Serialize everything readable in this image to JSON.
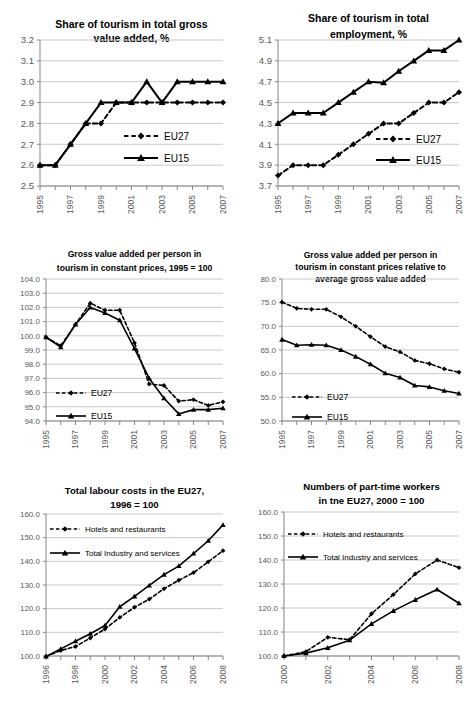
{
  "figure": {
    "panels": [
      {
        "id": "share-gva",
        "chart_data": {
          "type": "line",
          "title": "Share of tourism in total gross value added, %",
          "title_lines": [
            "Share of tourism in total gross",
            "value added, %"
          ],
          "title_bold": true,
          "xlabel": "",
          "ylabel": "",
          "x": [
            1995,
            1996,
            1997,
            1998,
            1999,
            2000,
            2001,
            2002,
            2003,
            2004,
            2005,
            2006,
            2007
          ],
          "xtick_labels": [
            "1995",
            "1997",
            "1999",
            "2001",
            "2003",
            "2005",
            "2007"
          ],
          "xtick_values": [
            1995,
            1997,
            1999,
            2001,
            2003,
            2005,
            2007
          ],
          "ylim": [
            2.5,
            3.2
          ],
          "yticks": [
            2.5,
            2.6,
            2.7,
            2.8,
            2.9,
            3.0,
            3.1,
            3.2
          ],
          "ytick_labels": [
            "2.5",
            "2.6",
            "2.7",
            "2.8",
            "2.9",
            "3.0",
            "3.1",
            "3.2"
          ],
          "grid": true,
          "legend_position": "inside-center-right",
          "series": [
            {
              "name": "EU27",
              "style": "dashed",
              "marker": "diamond",
              "values": [
                2.6,
                2.6,
                2.7,
                2.8,
                2.8,
                2.9,
                2.9,
                2.9,
                2.9,
                2.9,
                2.9,
                2.9,
                2.9
              ]
            },
            {
              "name": "EU15",
              "style": "solid",
              "marker": "triangle",
              "values": [
                2.6,
                2.6,
                2.7,
                2.8,
                2.9,
                2.9,
                2.9,
                3.0,
                2.9,
                3.0,
                3.0,
                3.0,
                3.0
              ]
            }
          ]
        }
      },
      {
        "id": "share-employment",
        "chart_data": {
          "type": "line",
          "title": "Share of tourism in total employment, %",
          "title_lines": [
            "Share of tourism in total",
            "employment, %"
          ],
          "title_bold": true,
          "xlabel": "",
          "ylabel": "",
          "x": [
            1995,
            1996,
            1997,
            1998,
            1999,
            2000,
            2001,
            2002,
            2003,
            2004,
            2005,
            2006,
            2007
          ],
          "xtick_labels": [
            "1995",
            "1997",
            "1999",
            "2001",
            "2003",
            "2005",
            "2007"
          ],
          "xtick_values": [
            1995,
            1997,
            1999,
            2001,
            2003,
            2005,
            2007
          ],
          "ylim": [
            3.7,
            5.1
          ],
          "yticks": [
            3.7,
            3.9,
            4.1,
            4.3,
            4.5,
            4.7,
            4.9,
            5.1
          ],
          "ytick_labels": [
            "3.7",
            "3.9",
            "4.1",
            "4.3",
            "4.5",
            "4.7",
            "4.9",
            "5.1"
          ],
          "grid": true,
          "legend_position": "inside-center-right",
          "series": [
            {
              "name": "EU27",
              "style": "dashed",
              "marker": "diamond",
              "values": [
                3.8,
                3.9,
                3.9,
                3.9,
                4.0,
                4.1,
                4.2,
                4.3,
                4.3,
                4.4,
                4.5,
                4.5,
                4.6
              ]
            },
            {
              "name": "EU15",
              "style": "solid",
              "marker": "triangle",
              "values": [
                4.3,
                4.4,
                4.4,
                4.4,
                4.5,
                4.6,
                4.7,
                4.69,
                4.8,
                4.9,
                5.0,
                5.0,
                5.1
              ]
            }
          ]
        }
      },
      {
        "id": "gva-per-person",
        "chart_data": {
          "type": "line",
          "title": "Gross value added per person in tourism in constant prices, 1995 = 100",
          "title_lines": [
            "Gross value added per person in",
            "tourism in constant prices, 1995 = 100"
          ],
          "title_bold": true,
          "xlabel": "",
          "ylabel": "",
          "x": [
            1995,
            1996,
            1997,
            1998,
            1999,
            2000,
            2001,
            2002,
            2003,
            2004,
            2005,
            2006,
            2007
          ],
          "xtick_labels": [
            "1995",
            "1997",
            "1999",
            "2001",
            "2003",
            "2005",
            "2007"
          ],
          "xtick_values": [
            1995,
            1997,
            1999,
            2001,
            2003,
            2005,
            2007
          ],
          "ylim": [
            94.0,
            104.0
          ],
          "yticks": [
            94.0,
            95.0,
            96.0,
            97.0,
            98.0,
            99.0,
            100.0,
            101.0,
            102.0,
            103.0,
            104.0
          ],
          "ytick_labels": [
            "94.0",
            "95.0",
            "96.0",
            "97.0",
            "98.0",
            "99.0",
            "100.0",
            "101.0",
            "102.0",
            "103.0",
            "104.0"
          ],
          "grid": true,
          "legend_position": "inside-left",
          "series": [
            {
              "name": "EU27",
              "style": "dashed",
              "marker": "diamond",
              "values": [
                99.9,
                99.3,
                100.8,
                102.3,
                101.8,
                101.8,
                99.5,
                96.6,
                96.5,
                95.4,
                95.5,
                95.1,
                95.35
              ]
            },
            {
              "name": "EU15",
              "style": "solid",
              "marker": "triangle",
              "values": [
                99.9,
                99.2,
                100.8,
                102.0,
                101.6,
                101.1,
                99.1,
                97.0,
                95.6,
                94.5,
                94.8,
                94.8,
                94.9
              ]
            }
          ]
        }
      },
      {
        "id": "gva-relative",
        "chart_data": {
          "type": "line",
          "title": "Gross value added per person in tourism in constant prices relative to average gross value added",
          "title_lines": [
            "Gross value added per person in",
            "tourism in constant prices relative to",
            "average gross value added"
          ],
          "title_bold": false,
          "xlabel": "",
          "ylabel": "",
          "x": [
            1995,
            1996,
            1997,
            1998,
            1999,
            2000,
            2001,
            2002,
            2003,
            2004,
            2005,
            2006,
            2007
          ],
          "xtick_labels": [
            "1995",
            "1997",
            "1999",
            "2001",
            "2003",
            "2005",
            "2007"
          ],
          "xtick_values": [
            1995,
            1997,
            1999,
            2001,
            2003,
            2005,
            2007
          ],
          "ylim": [
            50.0,
            80.0
          ],
          "yticks": [
            50.0,
            55.0,
            60.0,
            65.0,
            70.0,
            75.0,
            80.0
          ],
          "ytick_labels": [
            "50.0",
            "55.0",
            "60.0",
            "65.0",
            "70.0",
            "75.0",
            "80.0"
          ],
          "grid": true,
          "legend_position": "inside-left-lower",
          "series": [
            {
              "name": "EU27",
              "style": "dashed",
              "marker": "diamond",
              "values": [
                75.1,
                73.8,
                73.6,
                73.6,
                72.0,
                70.0,
                67.8,
                65.7,
                64.6,
                62.8,
                62.1,
                61.0,
                60.3
              ]
            },
            {
              "name": "EU15",
              "style": "solid",
              "marker": "triangle",
              "values": [
                67.2,
                66.0,
                66.1,
                66.0,
                65.0,
                63.6,
                62.0,
                60.1,
                59.2,
                57.5,
                57.2,
                56.4,
                55.8
              ]
            }
          ]
        }
      },
      {
        "id": "labour-costs",
        "chart_data": {
          "type": "line",
          "title": "Total labour costs in the EU27, 1996 = 100",
          "title_lines": [
            "Total labour costs in the EU27,",
            "1996 = 100"
          ],
          "title_bold": true,
          "xlabel": "",
          "ylabel": "",
          "x": [
            1996,
            1997,
            1998,
            1999,
            2000,
            2001,
            2002,
            2003,
            2004,
            2005,
            2006,
            2007,
            2008
          ],
          "xtick_labels": [
            "1996",
            "1998",
            "2000",
            "2002",
            "2004",
            "2006",
            "2008"
          ],
          "xtick_values": [
            1996,
            1998,
            2000,
            2002,
            2004,
            2006,
            2008
          ],
          "ylim": [
            100.0,
            160.0
          ],
          "yticks": [
            100.0,
            110.0,
            120.0,
            130.0,
            140.0,
            150.0,
            160.0
          ],
          "ytick_labels": [
            "100.0",
            "110.0",
            "120.0",
            "130.0",
            "140.0",
            "150.0",
            "160.0"
          ],
          "grid": true,
          "legend_position": "inside-top-left",
          "series": [
            {
              "name": "Hotels and restaurants",
              "style": "dashed",
              "marker": "diamond",
              "values": [
                99.8,
                102.3,
                104.0,
                107.6,
                111.4,
                116.3,
                120.6,
                124.0,
                128.4,
                132.0,
                135.2,
                139.8,
                144.5
              ]
            },
            {
              "name": "Total Industry and services",
              "style": "solid",
              "marker": "triangle",
              "values": [
                99.8,
                103.0,
                106.2,
                109.4,
                112.9,
                120.8,
                125.2,
                129.8,
                134.4,
                138.0,
                143.3,
                148.7,
                155.4
              ]
            }
          ]
        }
      },
      {
        "id": "part-time-workers",
        "chart_data": {
          "type": "line",
          "title": "Numbers of part-time workers in tne EU27, 2000 = 100",
          "title_lines": [
            "Numbers of part-time workers",
            "in tne EU27, 2000 = 100"
          ],
          "title_bold": true,
          "xlabel": "",
          "ylabel": "",
          "x": [
            2000,
            2001,
            2002,
            2003,
            2004,
            2005,
            2006,
            2007,
            2008
          ],
          "xtick_labels": [
            "2000",
            "2002",
            "2004",
            "2006",
            "2008"
          ],
          "xtick_values": [
            2000,
            2002,
            2004,
            2006,
            2008
          ],
          "ylim": [
            100.0,
            160.0
          ],
          "yticks": [
            100.0,
            110.0,
            120.0,
            130.0,
            140.0,
            150.0,
            160.0
          ],
          "ytick_labels": [
            "100.0",
            "110.0",
            "120.0",
            "130.0",
            "140.0",
            "150.0",
            "160.0"
          ],
          "grid": true,
          "legend_position": "inside-top-left",
          "series": [
            {
              "name": "Hotels and restaurants",
              "style": "dashed",
              "marker": "diamond",
              "values": [
                100.0,
                101.8,
                107.8,
                106.8,
                117.6,
                125.6,
                134.2,
                140.0,
                136.8
              ]
            },
            {
              "name": "Total Industry and services",
              "style": "solid",
              "marker": "triangle",
              "values": [
                100.0,
                101.2,
                103.4,
                106.6,
                113.4,
                118.8,
                123.4,
                127.7,
                122.0
              ]
            }
          ]
        }
      }
    ]
  }
}
